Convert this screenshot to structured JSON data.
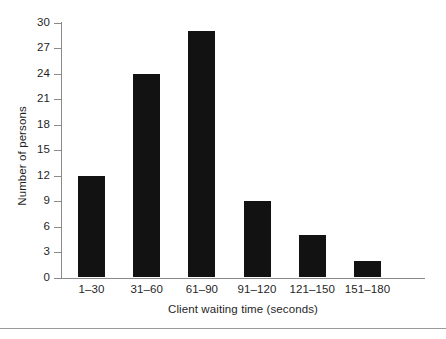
{
  "chart_data": {
    "type": "bar",
    "title": "",
    "subtitle": "",
    "xlabel": "Client waiting time (seconds)",
    "ylabel": "Number of persons",
    "categories": [
      "1–30",
      "31–60",
      "61–90",
      "91–120",
      "121–150",
      "151–180"
    ],
    "values": [
      12,
      24,
      29,
      9,
      5,
      2
    ],
    "ylim": [
      0,
      30
    ],
    "y_ticks": [
      0,
      3,
      6,
      9,
      12,
      15,
      18,
      21,
      24,
      27,
      30
    ],
    "y_tick_labels": [
      "0",
      "3",
      "6",
      "9",
      "12",
      "15",
      "18",
      "21",
      "24",
      "27",
      "30"
    ],
    "grid": false,
    "legend": null,
    "legend_position": "none",
    "bar_color": "#121212",
    "axis_color": "#8a8a8a",
    "text_color": "#1f1f1f",
    "background": "#ffffff",
    "annotations": []
  },
  "figure": {
    "footer_rule_color": "#9b9b9b"
  }
}
